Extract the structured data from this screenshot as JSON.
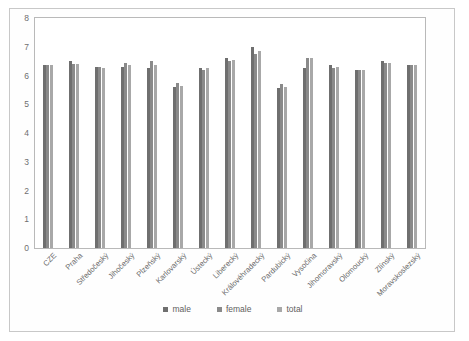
{
  "chart_data": {
    "type": "bar",
    "title": "",
    "subtitle": "",
    "xlabel": "",
    "ylabel": "",
    "ylim": [
      0,
      8
    ],
    "yticks": [
      0,
      1,
      2,
      3,
      4,
      5,
      6,
      7,
      8
    ],
    "grid": false,
    "legend_position": "bottom",
    "categories": [
      "CZE",
      "Praha",
      "Středočeský",
      "Jihočeský",
      "Plzeňský",
      "Karlovarský",
      "Ústecký",
      "Liberecký",
      "Královéhradecký",
      "Pardubický",
      "Vysočina",
      "Jihomoravský",
      "Olomoucký",
      "Zlínský",
      "Moravskoslezský"
    ],
    "series": [
      {
        "name": "male",
        "color": "#6f6f6f",
        "values": [
          6.35,
          6.5,
          6.3,
          6.3,
          6.25,
          5.6,
          6.25,
          6.6,
          7.0,
          5.55,
          6.25,
          6.35,
          6.2,
          6.5,
          6.35
        ]
      },
      {
        "name": "female",
        "color": "#8a8a8a",
        "values": [
          6.35,
          6.4,
          6.3,
          6.45,
          6.5,
          5.75,
          6.2,
          6.5,
          6.75,
          5.7,
          6.6,
          6.25,
          6.2,
          6.45,
          6.35
        ]
      },
      {
        "name": "total",
        "color": "#a8a8a8",
        "values": [
          6.35,
          6.4,
          6.25,
          6.35,
          6.35,
          5.65,
          6.25,
          6.55,
          6.85,
          5.6,
          6.6,
          6.3,
          6.2,
          6.45,
          6.35
        ]
      }
    ]
  },
  "legend": {
    "items": [
      {
        "label": "male",
        "color": "#6f6f6f"
      },
      {
        "label": "female",
        "color": "#8a8a8a"
      },
      {
        "label": "total",
        "color": "#a8a8a8"
      }
    ]
  }
}
